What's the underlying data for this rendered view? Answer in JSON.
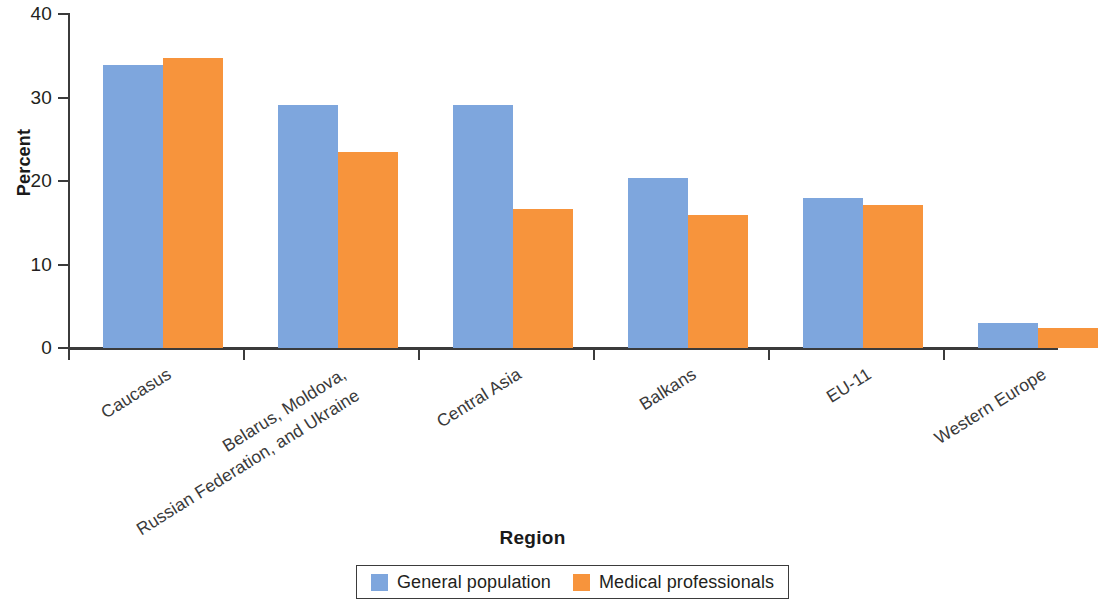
{
  "chart_data": {
    "type": "bar",
    "title": "",
    "subtitle": "",
    "xlabel": "Region",
    "ylabel": "Percent",
    "ylim": [
      0,
      40
    ],
    "yticks": [
      0,
      10,
      20,
      30,
      40
    ],
    "ytick_labels": [
      "0",
      "10",
      "20",
      "30",
      "40"
    ],
    "grid": false,
    "legend_position": "bottom-center",
    "categories": [
      "Caucasus",
      "Belarus, Moldova, Russian Federation, and Ukraine",
      "Central Asia",
      "Balkans",
      "EU-11",
      "Western Europe"
    ],
    "category_lines": [
      [
        "Caucasus"
      ],
      [
        "Belarus, Moldova,",
        "Russian Federation, and Ukraine"
      ],
      [
        "Central Asia"
      ],
      [
        "Balkans"
      ],
      [
        "EU-11"
      ],
      [
        "Western Europe"
      ]
    ],
    "series": [
      {
        "name": "General population",
        "color": "#7ea6dd",
        "values": [
          33.9,
          29.1,
          29.1,
          20.4,
          18.0,
          3.0
        ]
      },
      {
        "name": "Medical professionals",
        "color": "#f7943c",
        "values": [
          34.7,
          23.5,
          16.7,
          15.9,
          17.1,
          2.4
        ]
      }
    ]
  },
  "axis": {
    "y_title": "Percent",
    "x_title": "Region"
  },
  "legend": {
    "items": [
      {
        "label": "General population",
        "color": "#7ea6dd"
      },
      {
        "label": "Medical professionals",
        "color": "#f7943c"
      }
    ]
  },
  "colors": {
    "general_population": "#7ea6dd",
    "medical_professionals": "#f7943c",
    "axis": "#3b3b3b",
    "text": "#231f20",
    "background": "#ffffff"
  }
}
